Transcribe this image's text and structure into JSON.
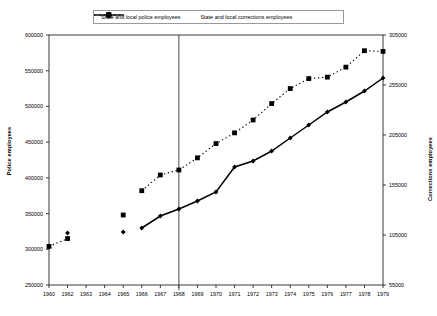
{
  "chart_data": {
    "type": "line",
    "title": "",
    "xlabel": "",
    "ylabel": "Police employees",
    "y2label": "Corrections employees",
    "grid": false,
    "legend_position": "top",
    "x": [
      1960,
      1962,
      1963,
      1964,
      1965,
      1966,
      1967,
      1968,
      1969,
      1970,
      1971,
      1972,
      1973,
      1974,
      1975,
      1976,
      1977,
      1978,
      1979
    ],
    "xtick_labels": [
      "1960",
      "1962",
      "1963",
      "1964",
      "1965",
      "1966",
      "1967",
      "1968",
      "1969",
      "1970",
      "1971",
      "1972",
      "1973",
      "1974",
      "1975",
      "1976",
      "1977",
      "1978",
      "1979"
    ],
    "xlim": [
      1959.5,
      1979.5
    ],
    "ylim": [
      250000,
      600000
    ],
    "ytick_labels": [
      "250000",
      "300000",
      "350000",
      "400000",
      "450000",
      "500000",
      "550000",
      "600000"
    ],
    "ytick_values": [
      250000,
      300000,
      350000,
      400000,
      450000,
      500000,
      550000,
      600000
    ],
    "y2lim": [
      55000,
      305000
    ],
    "y2tick_labels": [
      "55000",
      "105000",
      "155000",
      "205000",
      "255000",
      "305000"
    ],
    "y2tick_values": [
      55000,
      105000,
      155000,
      205000,
      255000,
      305000
    ],
    "annotations": [
      {
        "name": "vertical-reference-line",
        "x": 1968
      }
    ],
    "series": [
      {
        "name": "State and local police employees",
        "axis": "left",
        "style": "dashed",
        "marker": "square",
        "color": "#000000",
        "points": [
          {
            "x": 1960,
            "y": 304000,
            "connected": false
          },
          {
            "x": 1962,
            "y": 315000,
            "connected": false
          },
          {
            "x": 1965,
            "y": 348000,
            "connected": false
          },
          {
            "x": 1966,
            "y": 382000,
            "connected": true
          },
          {
            "x": 1967,
            "y": 404000,
            "connected": true
          },
          {
            "x": 1968,
            "y": 411000,
            "connected": true
          },
          {
            "x": 1969,
            "y": 428000,
            "connected": true
          },
          {
            "x": 1970,
            "y": 448000,
            "connected": true
          },
          {
            "x": 1971,
            "y": 463000,
            "connected": true
          },
          {
            "x": 1972,
            "y": 481000,
            "connected": true
          },
          {
            "x": 1973,
            "y": 504000,
            "connected": true
          },
          {
            "x": 1974,
            "y": 525000,
            "connected": true
          },
          {
            "x": 1975,
            "y": 539000,
            "connected": true
          },
          {
            "x": 1976,
            "y": 541000,
            "connected": true
          },
          {
            "x": 1977,
            "y": 555000,
            "connected": true
          },
          {
            "x": 1978,
            "y": 578000,
            "connected": true
          },
          {
            "x": 1979,
            "y": 577000,
            "connected": true
          }
        ]
      },
      {
        "name": "State and local corrections employees",
        "axis": "right",
        "style": "solid",
        "marker": "diamond",
        "color": "#000000",
        "points": [
          {
            "x": 1962,
            "y": 107000,
            "connected": false
          },
          {
            "x": 1965,
            "y": 108000,
            "connected": false
          },
          {
            "x": 1966,
            "y": 112000,
            "connected": true
          },
          {
            "x": 1967,
            "y": 124000,
            "connected": true
          },
          {
            "x": 1968,
            "y": 131000,
            "connected": true
          },
          {
            "x": 1969,
            "y": 139000,
            "connected": true
          },
          {
            "x": 1970,
            "y": 148000,
            "connected": true
          },
          {
            "x": 1971,
            "y": 173000,
            "connected": true
          },
          {
            "x": 1972,
            "y": 179000,
            "connected": true
          },
          {
            "x": 1973,
            "y": 189000,
            "connected": true
          },
          {
            "x": 1974,
            "y": 202000,
            "connected": true
          },
          {
            "x": 1975,
            "y": 215000,
            "connected": true
          },
          {
            "x": 1976,
            "y": 228000,
            "connected": true
          },
          {
            "x": 1977,
            "y": 238000,
            "connected": true
          },
          {
            "x": 1978,
            "y": 249000,
            "connected": true
          },
          {
            "x": 1979,
            "y": 262000,
            "connected": true
          }
        ]
      }
    ]
  },
  "legend": {
    "items": [
      {
        "label": "State and local police employees",
        "style": "dashed",
        "marker": "square"
      },
      {
        "label": "State and local corrections employees",
        "style": "solid",
        "marker": "diamond"
      }
    ]
  }
}
